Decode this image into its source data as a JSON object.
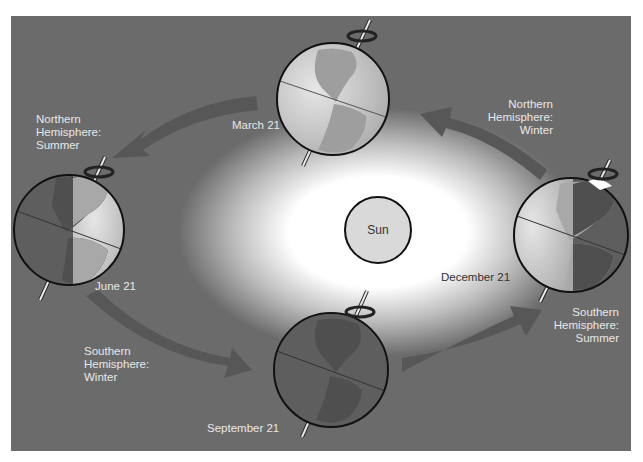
{
  "diagram": {
    "colors": {
      "background": "#6b6b6b",
      "page": "#ffffff",
      "arrow": "#575757",
      "glow": "#ffffff",
      "sun_fill": "#d9d9d9",
      "outline": "#111111",
      "globe_day": "#c8c8c8",
      "globe_night": "#5e5e5e",
      "land_day": "#a8a8a8",
      "land_night": "#4f4f4f",
      "label_light": "#e8e8e8",
      "label_dark": "#333333"
    },
    "sun": {
      "label": "Sun"
    },
    "positions": [
      {
        "id": "march",
        "date": "March 21",
        "globe_lighting": "full-day"
      },
      {
        "id": "june",
        "date": "June 21",
        "globe_lighting": "right-half-day",
        "season_label": [
          "Northern",
          "Hemisphere:",
          "Summer"
        ]
      },
      {
        "id": "september",
        "date": "September 21",
        "globe_lighting": "full-night",
        "season_label": [
          "Southern",
          "Hemisphere:",
          "Winter"
        ]
      },
      {
        "id": "december",
        "date": "December 21",
        "globe_lighting": "left-half-day",
        "season_label_north": [
          "Northern",
          "Hemisphere:",
          "Winter"
        ],
        "season_label_south": [
          "Southern",
          "Hemisphere:",
          "Summer"
        ]
      }
    ],
    "arrows": [
      {
        "from": "March 21",
        "to": "June 21",
        "icon": "curved-arrow"
      },
      {
        "from": "June 21",
        "to": "September 21",
        "icon": "curved-arrow"
      },
      {
        "from": "September 21",
        "to": "December 21",
        "icon": "curved-arrow"
      },
      {
        "from": "December 21",
        "to": "March 21",
        "icon": "curved-arrow"
      }
    ],
    "icons": {
      "rotation": "rotation-arrow-icon",
      "axis": "earth-axis-icon"
    }
  }
}
